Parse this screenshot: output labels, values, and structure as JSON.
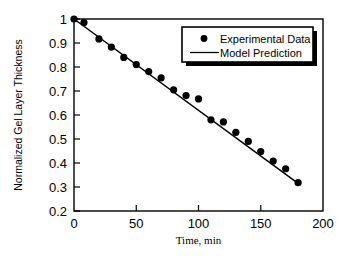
{
  "chart_data": {
    "type": "scatter",
    "title": "",
    "xlabel": "Time, min",
    "ylabel": "Normalized Gel Layer Thickness",
    "xlim": [
      0,
      200
    ],
    "ylim": [
      0.2,
      1.0
    ],
    "xticks": [
      0,
      50,
      100,
      150,
      200
    ],
    "xtick_labels": [
      "0",
      "50",
      "100",
      "150",
      "200"
    ],
    "yticks": [
      0.2,
      0.3,
      0.4,
      0.5,
      0.6,
      0.7,
      0.8,
      0.9,
      1.0
    ],
    "ytick_labels": [
      "0.2",
      "0.3",
      "0.4",
      "0.5",
      "0.6",
      "0.7",
      "0.8",
      "0.9",
      "1"
    ],
    "grid": false,
    "legend_position": "upper-right",
    "series": [
      {
        "name": "Experimental Data",
        "type": "scatter",
        "marker": "filled-circle",
        "color": "#000000",
        "x": [
          0,
          8,
          20,
          30,
          40,
          50,
          60,
          70,
          80,
          90,
          100,
          110,
          120,
          130,
          140,
          150,
          160,
          170,
          180
        ],
        "y": [
          1.0,
          0.985,
          0.917,
          0.883,
          0.84,
          0.81,
          0.781,
          0.755,
          0.705,
          0.681,
          0.667,
          0.58,
          0.571,
          0.528,
          0.49,
          0.448,
          0.408,
          0.376,
          0.318
        ]
      },
      {
        "name": "Model Prediction",
        "type": "line",
        "color": "#000000",
        "x": [
          0,
          180
        ],
        "y": [
          1.0,
          0.315
        ]
      }
    ]
  },
  "legend": {
    "entries": [
      {
        "label": "Experimental Data",
        "marker": "filled-circle"
      },
      {
        "label": "Model Prediction",
        "marker": "line"
      }
    ]
  },
  "axes": {
    "x_axis_title": "Time, min",
    "y_axis_title": "Normalized Gel Layer Thickness"
  }
}
